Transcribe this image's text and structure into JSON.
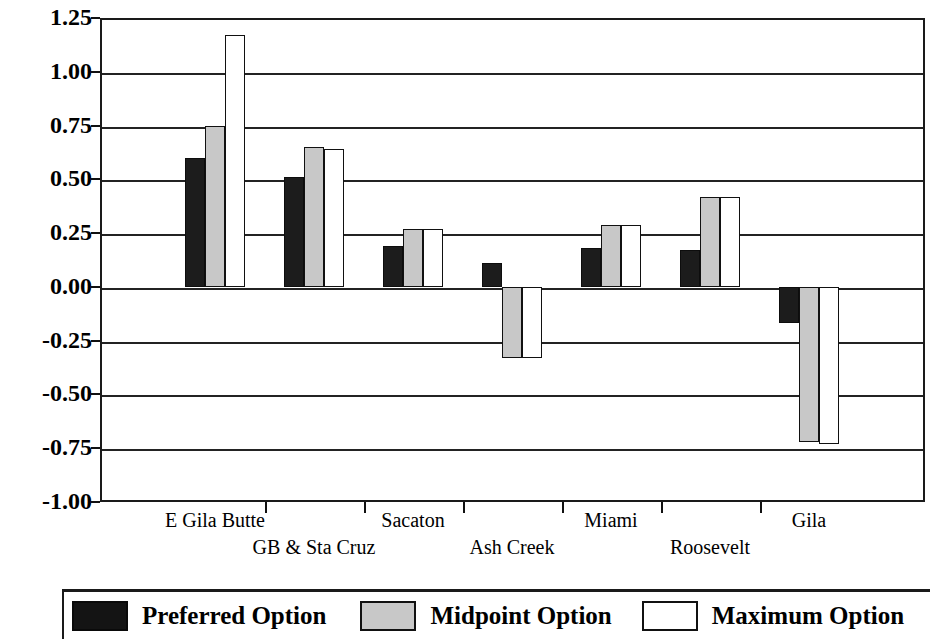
{
  "chart_data": {
    "type": "bar",
    "title": "",
    "xlabel": "",
    "ylabel": "Annual Percentage Change",
    "ylim": [
      -1.0,
      1.25
    ],
    "ytick_labels": [
      "1.25",
      "1.00",
      "0.75",
      "0.50",
      "0.25",
      "0.00",
      "-0.25",
      "-0.50",
      "-0.75",
      "-1.00"
    ],
    "ytick_values": [
      1.25,
      1.0,
      0.75,
      0.5,
      0.25,
      0.0,
      -0.25,
      -0.5,
      -0.75,
      -1.0
    ],
    "grid": true,
    "legend_position": "bottom",
    "categories": [
      "E Gila Butte",
      "GB & Sta Cruz",
      "Sacaton",
      "Ash Creek",
      "Miami",
      "Roosevelt",
      "Gila"
    ],
    "series": [
      {
        "name": "Preferred Option",
        "color": "#1c1c1c",
        "values": [
          0.6,
          0.51,
          0.19,
          0.11,
          0.18,
          0.17,
          -0.17
        ]
      },
      {
        "name": "Midpoint Option",
        "color": "#c8c8c8",
        "values": [
          0.75,
          0.65,
          0.27,
          -0.33,
          0.29,
          0.42,
          -0.72
        ]
      },
      {
        "name": "Maximum Option",
        "color": "#ffffff",
        "values": [
          1.17,
          0.64,
          0.27,
          -0.33,
          0.29,
          0.42,
          -0.73
        ]
      }
    ]
  },
  "axis": {
    "y_title": "Annual Percentage Change"
  },
  "legend": {
    "items": [
      {
        "label": "Preferred Option",
        "swatch": "preferred"
      },
      {
        "label": "Midpoint Option",
        "swatch": "midpoint"
      },
      {
        "label": "Maximum Option",
        "swatch": "maximum"
      }
    ]
  }
}
